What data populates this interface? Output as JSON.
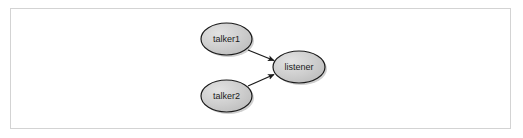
{
  "figure": {
    "type": "node-graph-diagram",
    "frame": {
      "border_color": "#d3d3d3",
      "background_color": "#ffffff"
    },
    "style": {
      "node_fill_color": "#c8c8c8",
      "node_fill_highlight": "#e0e0e0",
      "node_stroke_color": "#1a1a1a",
      "node_label_color": "#1a1a1a",
      "edge_color": "#1a1a1a",
      "shadow_color": "#9a9a9a"
    },
    "nodes": [
      {
        "id": "talker1",
        "label": "talker1",
        "cx": 226.5,
        "cy": 39,
        "rx": 25.5,
        "ry": 16
      },
      {
        "id": "talker2",
        "label": "talker2",
        "cx": 226.5,
        "cy": 96,
        "rx": 25.5,
        "ry": 16
      },
      {
        "id": "listener",
        "label": "listener",
        "cx": 299.0,
        "cy": 67,
        "rx": 26.0,
        "ry": 16
      }
    ],
    "edges": [
      {
        "id": "edge-talker1-listener",
        "from": "talker1",
        "to": "listener",
        "x1": 248,
        "y1": 50,
        "x2": 275,
        "y2": 61,
        "arrowhead": "filled-triangle"
      },
      {
        "id": "edge-talker2-listener",
        "from": "talker2",
        "to": "listener",
        "x1": 248,
        "y1": 86,
        "x2": 275,
        "y2": 74,
        "arrowhead": "filled-triangle"
      }
    ]
  }
}
